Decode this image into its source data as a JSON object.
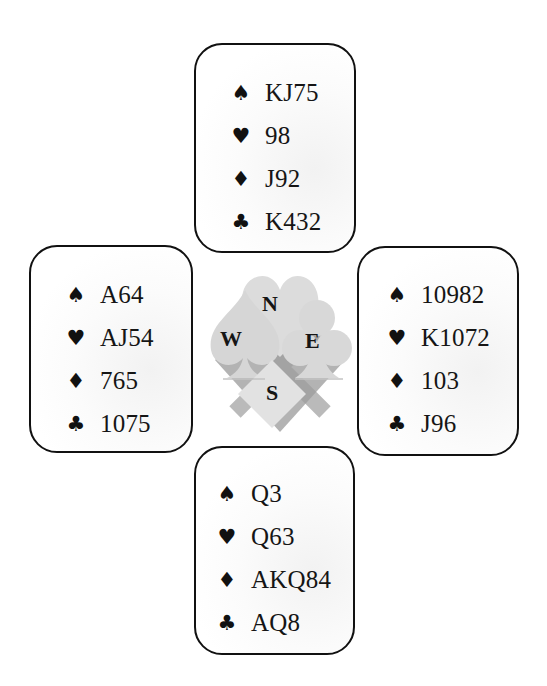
{
  "deal": {
    "north": {
      "label": "N",
      "suits": [
        {
          "suit": "spades",
          "symbol": "♠",
          "cards": "KJ75"
        },
        {
          "suit": "hearts",
          "symbol": "♥",
          "cards": "98"
        },
        {
          "suit": "diamonds",
          "symbol": "♦",
          "cards": "J92"
        },
        {
          "suit": "clubs",
          "symbol": "♣",
          "cards": "K432"
        }
      ]
    },
    "west": {
      "label": "W",
      "suits": [
        {
          "suit": "spades",
          "symbol": "♠",
          "cards": "A64"
        },
        {
          "suit": "hearts",
          "symbol": "♥",
          "cards": "AJ54"
        },
        {
          "suit": "diamonds",
          "symbol": "♦",
          "cards": "765"
        },
        {
          "suit": "clubs",
          "symbol": "♣",
          "cards": "1075"
        }
      ]
    },
    "east": {
      "label": "E",
      "suits": [
        {
          "suit": "spades",
          "symbol": "♠",
          "cards": "10982"
        },
        {
          "suit": "hearts",
          "symbol": "♥",
          "cards": "K1072"
        },
        {
          "suit": "diamonds",
          "symbol": "♦",
          "cards": "103"
        },
        {
          "suit": "clubs",
          "symbol": "♣",
          "cards": "J96"
        }
      ]
    },
    "south": {
      "label": "S",
      "suits": [
        {
          "suit": "spades",
          "symbol": "♠",
          "cards": "Q3"
        },
        {
          "suit": "hearts",
          "symbol": "♥",
          "cards": "Q63"
        },
        {
          "suit": "diamonds",
          "symbol": "♦",
          "cards": "AKQ84"
        },
        {
          "suit": "clubs",
          "symbol": "♣",
          "cards": "AQ8"
        }
      ]
    }
  },
  "compass": {
    "north": "N",
    "west": "W",
    "east": "E",
    "south": "S"
  },
  "colors": {
    "border": "#111111",
    "text": "#151515",
    "compass_light": "#d9d9d9",
    "compass_dark": "#a8a8a8"
  }
}
